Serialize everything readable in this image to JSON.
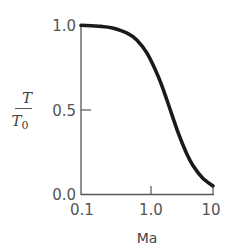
{
  "chart_data": {
    "type": "line",
    "title": "",
    "xlabel": "Ma",
    "ylabel": "T/T0",
    "xscale": "log",
    "xlim": [
      0.1,
      10
    ],
    "ylim": [
      0.0,
      1.0
    ],
    "x_ticks": [
      "0.1",
      "1.0",
      "10"
    ],
    "y_ticks": [
      "0.0",
      "0.5",
      "1.0"
    ],
    "grid": false,
    "legend": null,
    "series": [
      {
        "name": "T/T0",
        "x": [
          0.1,
          0.2,
          0.3,
          0.5,
          0.7,
          1.0,
          1.5,
          2.0,
          3.0,
          4.0,
          5.0,
          7.0,
          10.0
        ],
        "values": [
          0.998,
          0.992,
          0.982,
          0.952,
          0.911,
          0.833,
          0.69,
          0.556,
          0.357,
          0.238,
          0.167,
          0.093,
          0.048
        ]
      }
    ]
  },
  "labels": {
    "y_num": "T",
    "y_den": "T",
    "y_den_sub": "0",
    "x": "Ma",
    "y_ticks": [
      "1.0",
      "0.5",
      "0.0"
    ],
    "x_ticks": [
      "0.1",
      "1.0",
      "10"
    ]
  }
}
